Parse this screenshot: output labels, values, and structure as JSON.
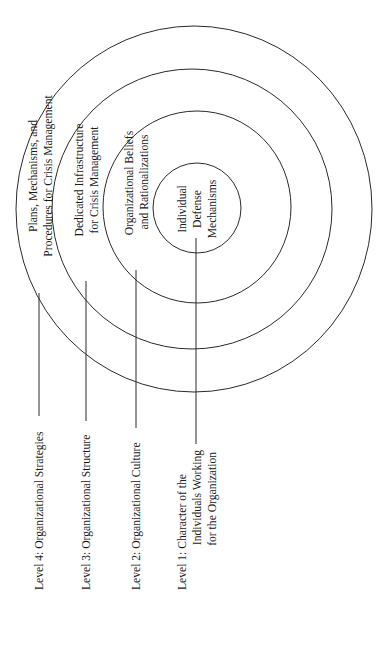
{
  "diagram": {
    "type": "concentric-onion-model",
    "orientation": "rotated-90-ccw",
    "levels": [
      {
        "level": 4,
        "label_lines": [
          "Level 4: Organizational Strategies"
        ],
        "ring_text_lines": [
          "Plans, Mechanisms, and",
          "Procedures for Crisis Management"
        ]
      },
      {
        "level": 3,
        "label_lines": [
          "Level 3: Organizational Structure"
        ],
        "ring_text_lines": [
          "Dedicated Infrastructure",
          "for Crisis Management"
        ]
      },
      {
        "level": 2,
        "label_lines": [
          "Level 2: Organizational Culture"
        ],
        "ring_text_lines": [
          "Organizational Beliefs",
          "and Rationalizations"
        ]
      },
      {
        "level": 1,
        "label_lines": [
          "Level 1: Character of the",
          "Individuals Working",
          "for the Organization"
        ],
        "ring_text_lines": [
          "Individual",
          "Defense",
          "Mechanisms"
        ]
      }
    ],
    "colors": {
      "background": "#ffffff",
      "stroke": "#2a2a2a",
      "text": "#1a1a1a"
    }
  }
}
